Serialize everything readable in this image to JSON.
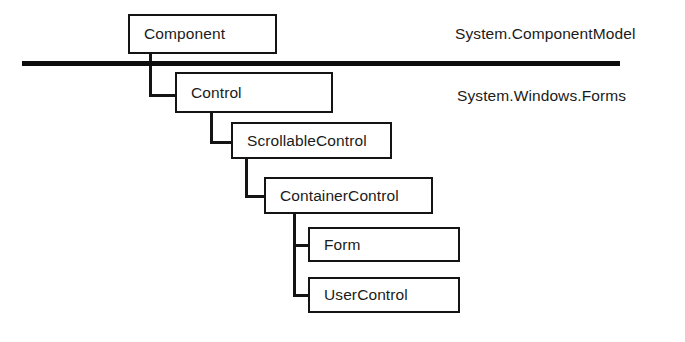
{
  "diagram": {
    "type": "class-inheritance-hierarchy",
    "colors": {
      "background": "#ffffff",
      "box_border": "#141414",
      "connector": "#141414",
      "divider": "#0d0d0d",
      "text": "#1b1b1b"
    },
    "divider": {
      "name": "namespace-divider",
      "x1": 22,
      "x2": 620,
      "y": 63,
      "thickness": 5
    },
    "namespaces": [
      {
        "id": "component-model",
        "label": "System.ComponentModel",
        "x": 455,
        "y": 26
      },
      {
        "id": "windows-forms",
        "label": "System.Windows.Forms",
        "x": 457,
        "y": 88
      }
    ],
    "nodes": [
      {
        "id": "component",
        "label": "Component",
        "x": 128,
        "y": 14,
        "width": 149,
        "height": 40
      },
      {
        "id": "control",
        "label": "Control",
        "x": 175,
        "y": 72,
        "width": 158,
        "height": 41
      },
      {
        "id": "scrollable-control",
        "label": "ScrollableControl",
        "x": 231,
        "y": 122,
        "width": 161,
        "height": 37
      },
      {
        "id": "container-control",
        "label": "ContainerControl",
        "x": 264,
        "y": 177,
        "width": 169,
        "height": 37
      },
      {
        "id": "form",
        "label": "Form",
        "x": 308,
        "y": 227,
        "width": 152,
        "height": 35
      },
      {
        "id": "user-control",
        "label": "UserControl",
        "x": 308,
        "y": 277,
        "width": 152,
        "height": 36
      }
    ],
    "connectors": [
      {
        "id": "component-to-control",
        "from": "component",
        "to": "control",
        "stub_x": 150,
        "start_y": 54,
        "elbow_y": 95,
        "end_x": 175
      },
      {
        "id": "control-to-scrollable-control",
        "from": "control",
        "to": "scrollable-control",
        "stub_x": 211,
        "start_y": 113,
        "elbow_y": 142,
        "end_x": 231
      },
      {
        "id": "scrollable-to-container-control",
        "from": "scrollable-control",
        "to": "container-control",
        "stub_x": 246,
        "start_y": 159,
        "elbow_y": 196,
        "end_x": 264
      },
      {
        "id": "container-to-form",
        "from": "container-control",
        "to": "form",
        "stub_x": 294,
        "start_y": 214,
        "elbow_y": 245,
        "end_x": 308
      },
      {
        "id": "container-to-user-control",
        "from": "container-control",
        "to": "user-control",
        "stub_x": 294,
        "start_y": 214,
        "elbow_y": 295,
        "end_x": 308
      }
    ]
  }
}
